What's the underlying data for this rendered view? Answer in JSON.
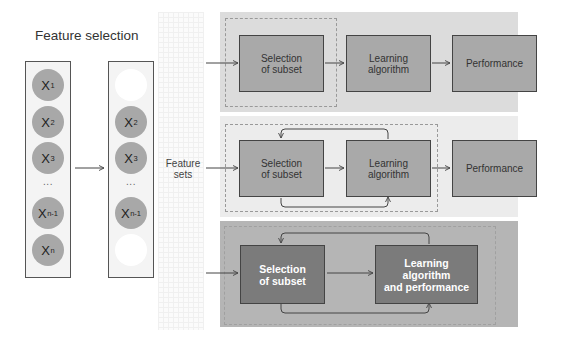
{
  "title": "Feature selection",
  "left_panel": {
    "all_features": [
      {
        "base": "X",
        "sub": "1"
      },
      {
        "base": "X",
        "sub": "2"
      },
      {
        "base": "X",
        "sub": "3"
      },
      {
        "ellipsis": "..."
      },
      {
        "base": "X",
        "sub": "n-1"
      },
      {
        "base": "X",
        "sub": "n"
      }
    ],
    "selected_features": [
      {
        "empty": true
      },
      {
        "base": "X",
        "sub": "2"
      },
      {
        "base": "X",
        "sub": "3"
      },
      {
        "ellipsis": "..."
      },
      {
        "base": "X",
        "sub": "n-1"
      },
      {
        "empty": true
      }
    ]
  },
  "feature_sets_label": [
    "Feature",
    "sets"
  ],
  "panels": [
    {
      "name": "filter",
      "boxes": [
        {
          "lines": [
            "Selection",
            "of subset"
          ]
        },
        {
          "lines": [
            "Learning",
            "algorithm"
          ]
        },
        {
          "lines": [
            "Performance"
          ]
        }
      ]
    },
    {
      "name": "wrapper",
      "boxes": [
        {
          "lines": [
            "Selection",
            "of subset"
          ]
        },
        {
          "lines": [
            "Learning",
            "algorithm"
          ]
        },
        {
          "lines": [
            "Performance"
          ]
        }
      ]
    },
    {
      "name": "embedded",
      "boxes": [
        {
          "lines": [
            "Selection",
            "of subset"
          ]
        },
        {
          "lines": [
            "Learning",
            "algorithm",
            "and performance"
          ]
        }
      ]
    }
  ],
  "colors": {
    "panel1_bg": "#dcdcdc",
    "panel2_bg": "#ececec",
    "panel3_bg": "#b5b5b5",
    "box_fill": "#a9a9a9",
    "box_dark_fill": "#7b7b7b",
    "circle_fill": "#a8a8a8"
  }
}
